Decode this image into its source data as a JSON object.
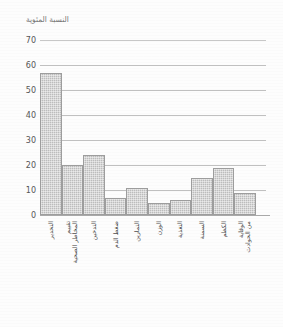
{
  "chart_data": {
    "type": "bar",
    "title": "النسبة المئوية",
    "xlabel": "",
    "ylabel": "النسبة المئوية",
    "ylim": [
      0,
      70
    ],
    "ytick_step": 10,
    "yticks": [
      "0",
      "10",
      "20",
      "30",
      "40",
      "50",
      "60",
      "70"
    ],
    "grid": true,
    "legend": false,
    "bar_color": "#bcbcbc",
    "bar_edge_color": "#9d9d9d",
    "grid_color": "#b5b5b5",
    "axis_color": "#9a9a9a",
    "text_color": "#555555",
    "categories": [
      "التخدير",
      "تقييم المخاطر الصحية",
      "التدخين",
      "ضغط الدم",
      "التمارين",
      "الوزن",
      "التغذية",
      "السمنة",
      "الكظم",
      "الوقاية من الحوادث"
    ],
    "categories_lines": [
      [
        "التخدير",
        ""
      ],
      [
        "تقييم",
        "المخاطر الصحية"
      ],
      [
        "التدخين",
        ""
      ],
      [
        "ضغط الدم",
        ""
      ],
      [
        "التمارين",
        ""
      ],
      [
        "الوزن",
        ""
      ],
      [
        "التغذية",
        ""
      ],
      [
        "السمنة",
        ""
      ],
      [
        "الكظم",
        ""
      ],
      [
        "الوقاية",
        "من الحوادث"
      ]
    ],
    "values": [
      57,
      20,
      24,
      7,
      11,
      5,
      6,
      15,
      19,
      9
    ],
    "series": [
      {
        "name": "النسبة المئوية",
        "values": [
          57,
          20,
          24,
          7,
          11,
          5,
          6,
          15,
          19,
          9
        ]
      }
    ]
  }
}
